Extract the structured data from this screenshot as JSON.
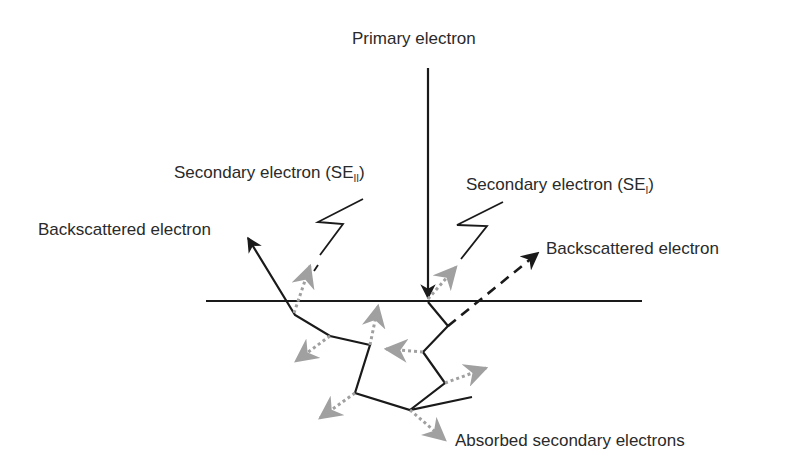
{
  "diagram": {
    "labels": {
      "primary": "Primary electron",
      "se2_prefix": "Secondary electron (SE",
      "se2_sub": "II",
      "se2_suffix": ")",
      "se1_prefix": "Secondary electron (SE",
      "se1_sub": "I",
      "se1_suffix": ")",
      "bse_left": "Backscattered electron",
      "bse_right": "Backscattered electron",
      "absorbed": "Absorbed secondary electrons"
    },
    "colors": {
      "stroke": "#1a1a1a",
      "secondary_arrows": "#a0a0a0",
      "text": "#2a2a2a",
      "background": "#ffffff"
    }
  }
}
